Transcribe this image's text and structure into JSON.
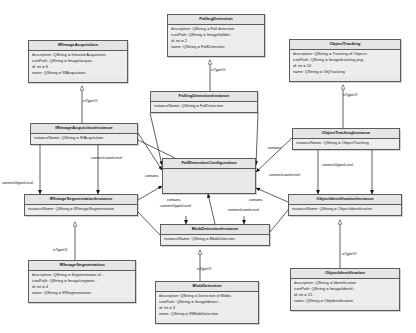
{
  "diagram": {
    "type": "uml-class-diagram",
    "background_color": "#ffffff",
    "box_fill_color": "#e9e9e9",
    "box_border_color": "#5c5c5c",
    "relation_types": [
      "isTypeOf",
      "contains",
      "connectUpperLevel",
      "connectLowerLevel"
    ]
  },
  "boxes": [
    {
      "id": "ir-image-acquisition",
      "title": "IRImageAcquisition",
      "x": 28,
      "y": 40,
      "w": 100,
      "h": 43,
      "attrs": [
        "description:  QString = Infrared Acquisition",
        "iconPath:  QString = Image/acquis...",
        "id:  int = 6",
        "name:  QString = IRAcquisition"
      ]
    },
    {
      "id": "falling-detection",
      "title": "FallingDetection",
      "x": 167,
      "y": 14,
      "w": 98,
      "h": 43,
      "attrs": [
        "description:  QString = Fall detection",
        "iconPath:  QString = Image/falldet...",
        "id:  int = 2",
        "name:  QString = FallDetection"
      ]
    },
    {
      "id": "object-tracking",
      "title": "ObjectTracking",
      "x": 289,
      "y": 39,
      "w": 112,
      "h": 43,
      "attrs": [
        "description:  QString = Tracking of Objects",
        "iconPath:  QString = Image/tracking.png",
        "id:  int = 10",
        "name:  QString = ObjTracking"
      ]
    },
    {
      "id": "ir-image-acquisition-instance",
      "title": "IRImageAcquisitionInstance",
      "x": 30,
      "y": 123,
      "w": 108,
      "h": 22,
      "attrs": [
        "instanceName:  QString = IRAcquisition"
      ]
    },
    {
      "id": "falling-detection-instance",
      "title": "FallingDetectionInstance",
      "x": 150,
      "y": 91,
      "w": 108,
      "h": 22,
      "attrs": [
        "instanceName:  QString = FallDetection"
      ]
    },
    {
      "id": "object-tracking-instance",
      "title": "ObjectTrackingInstance",
      "x": 292,
      "y": 128,
      "w": 108,
      "h": 22,
      "attrs": [
        "instanceName:  QString = ObjectTracking"
      ]
    },
    {
      "id": "fall-detection-configuration",
      "title": "FallDetectionConfiguration",
      "x": 162,
      "y": 158,
      "w": 94,
      "h": 36,
      "attrs": []
    },
    {
      "id": "ir-image-segmentation-instance",
      "title": "IRImageSegmentationInstance",
      "x": 24,
      "y": 194,
      "w": 114,
      "h": 22,
      "attrs": [
        "instanceName:  QString = IRImageSegmentation"
      ]
    },
    {
      "id": "object-identification-instance",
      "title": "ObjectIdentificationInstance",
      "x": 288,
      "y": 194,
      "w": 114,
      "h": 22,
      "attrs": [
        "instanceName:  QString = ObjectIdentification"
      ]
    },
    {
      "id": "blob-detection-instance",
      "title": "BlobDetectionInstance",
      "x": 160,
      "y": 224,
      "w": 110,
      "h": 22,
      "attrs": [
        "instanceName:  QString = BlobDetection"
      ]
    },
    {
      "id": "ir-image-segmentation",
      "title": "IRImageSegmentation",
      "x": 28,
      "y": 260,
      "w": 108,
      "h": 43,
      "attrs": [
        "description:  QString = Segmentation of...",
        "iconPath:  QString = Image/segmen...",
        "id:  int = 4",
        "name:  QString = IRSegmentation"
      ]
    },
    {
      "id": "blob-detection",
      "title": "BlobDetection",
      "x": 155,
      "y": 281,
      "w": 104,
      "h": 43,
      "attrs": [
        "description:  QString = Detection of Blobs",
        "iconPath:  QString = Image/detect...",
        "id:  int = 3",
        "name:  QString = IRBlobDetection"
      ]
    },
    {
      "id": "object-identification",
      "title": "ObjectIdentification",
      "x": 290,
      "y": 268,
      "w": 110,
      "h": 43,
      "attrs": [
        "description:  QString = Identification",
        "iconPath:  QString = Image/identif...",
        "id:  int = 15",
        "name:  QString = ObjIdentification"
      ]
    }
  ],
  "edge_labels": [
    {
      "id": "l1",
      "text": "isTypeOf",
      "x": 83,
      "y": 100
    },
    {
      "id": "l2",
      "text": "isTypeOf",
      "x": 211,
      "y": 69
    },
    {
      "id": "l3",
      "text": "isTypeOf",
      "x": 343,
      "y": 94
    },
    {
      "id": "l4",
      "text": "connectLowerLevel",
      "x": 91,
      "y": 157
    },
    {
      "id": "l5",
      "text": "contains",
      "x": 268,
      "y": 147
    },
    {
      "id": "l6",
      "text": "connectUpperLevel",
      "x": 2,
      "y": 182
    },
    {
      "id": "l7",
      "text": "contains",
      "x": 145,
      "y": 175
    },
    {
      "id": "l8",
      "text": "contains",
      "x": 167,
      "y": 199
    },
    {
      "id": "l9",
      "text": "contains",
      "x": 249,
      "y": 199
    },
    {
      "id": "l10",
      "text": "connectLowerLevel",
      "x": 269,
      "y": 174
    },
    {
      "id": "l11",
      "text": "connectUpperLevel",
      "x": 322,
      "y": 164
    },
    {
      "id": "l12",
      "text": "connectUpperLevel",
      "x": 160,
      "y": 205
    },
    {
      "id": "l13",
      "text": "connectLowerLevel",
      "x": 228,
      "y": 209
    },
    {
      "id": "l14",
      "text": "isTypeOf",
      "x": 53,
      "y": 249
    },
    {
      "id": "l15",
      "text": "isTypeOf",
      "x": 197,
      "y": 268
    },
    {
      "id": "l16",
      "text": "isTypeOf",
      "x": 342,
      "y": 253
    }
  ]
}
